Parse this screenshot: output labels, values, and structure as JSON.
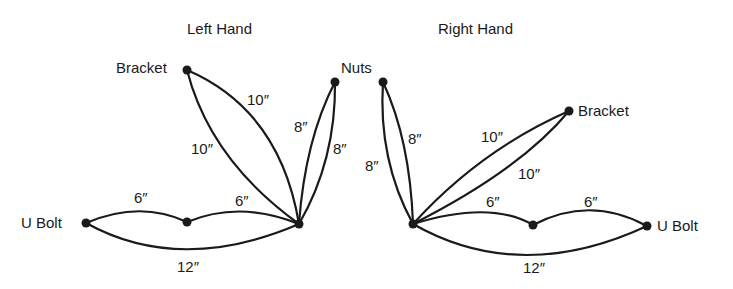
{
  "titles": {
    "left": "Left Hand",
    "right": "Right Hand"
  },
  "left": {
    "nodes": {
      "bracket": "Bracket",
      "nuts": "Nuts",
      "ubolt": "U Bolt"
    },
    "edges": {
      "bracket_outer": "10″",
      "bracket_inner": "10″",
      "nuts_left": "8″",
      "nuts_right": "8″",
      "ubolt_mid": "6″",
      "mid_hub": "6″",
      "ubolt_hub": "12″"
    }
  },
  "right": {
    "nodes": {
      "bracket": "Bracket",
      "ubolt": "U Bolt"
    },
    "edges": {
      "nuts_left": "8″",
      "nuts_right": "8″",
      "bracket_upper": "10″",
      "bracket_lower": "10″",
      "hub_mid": "6″",
      "mid_ubolt": "6″",
      "hub_ubolt": "12″"
    }
  }
}
